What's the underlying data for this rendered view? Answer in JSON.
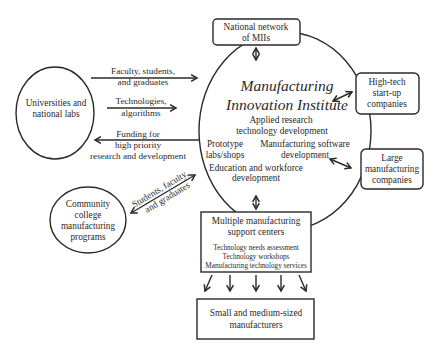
{
  "diagram": {
    "center": {
      "title_line1": "Manufacturing",
      "title_line2": "Innovation Institute",
      "activities": [
        "Applied research",
        "technology development",
        "Prototype",
        "labs/shops",
        "Manufacturing software",
        "development",
        "Education and workforce",
        "development"
      ]
    },
    "nodes": {
      "national_network": [
        "National network",
        "of MIIs"
      ],
      "universities": [
        "Universities and",
        "national labs"
      ],
      "high_tech": [
        "High-tech",
        "start-up",
        "companies"
      ],
      "large_mfg": [
        "Large",
        "manufacturing",
        "companies"
      ],
      "community_college": [
        "Community",
        "college",
        "manufacturing",
        "programs"
      ],
      "support_centers": {
        "title": [
          "Multiple manufacturing",
          "support centers"
        ],
        "services": [
          "Technology needs assessment",
          "Technology workshops",
          "Manufacturing technology services"
        ]
      },
      "sme": [
        "Small and medium-sized",
        "manufacturers"
      ]
    },
    "edges": {
      "faculty": [
        "Faculty, students,",
        "and graduates"
      ],
      "technologies": [
        "Technologies,",
        "algorithms"
      ],
      "funding": [
        "Funding for",
        "high priority",
        "research and development"
      ],
      "students": [
        "Students, faculty,",
        "and graduates"
      ]
    },
    "colors": {
      "stroke": "#2a2a2a",
      "text": "#2a2a2a",
      "background": "#ffffff"
    }
  }
}
